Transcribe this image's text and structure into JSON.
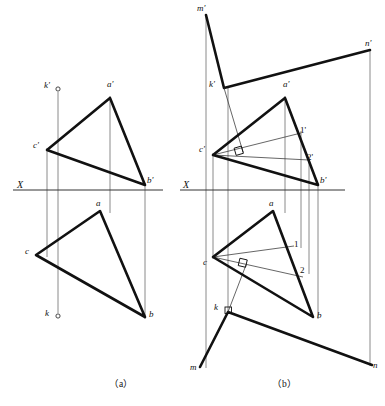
{
  "figure": {
    "type": "descriptive-geometry-orthographic-projection",
    "captions": [
      {
        "id": "cap-a",
        "text": "（a）",
        "x": 120,
        "y": 381
      },
      {
        "id": "cap-b",
        "text": "（b）",
        "x": 283,
        "y": 381
      }
    ],
    "axis_label": "X",
    "colors": {
      "ink": "#111111",
      "thin_line": "#555555",
      "projection_line": "#6d6d6d",
      "background": "#ffffff"
    },
    "stroke_widths": {
      "heavy": 2.6,
      "axis": 1.0,
      "thin": 0.7,
      "projector": 0.7
    }
  },
  "panel_a": {
    "name": "panel-a",
    "x_axis": {
      "x1": 13,
      "y1": 190,
      "x2": 163,
      "y2": 190
    },
    "x_axis_label": {
      "text": "X",
      "x": 18,
      "y": 180
    },
    "points": {
      "a_front": {
        "label": "a'",
        "x": 110,
        "y": 98
      },
      "b_front": {
        "label": "b'",
        "x": 145,
        "y": 185
      },
      "c_front": {
        "label": "c'",
        "x": 47,
        "y": 150
      },
      "a_top": {
        "label": "a",
        "x": 100,
        "y": 211
      },
      "b_top": {
        "label": "b",
        "x": 145,
        "y": 317
      },
      "c_top": {
        "label": "c",
        "x": 36,
        "y": 255
      },
      "k_front": {
        "label": "k'",
        "x": 58,
        "y": 89
      },
      "k_top": {
        "label": "k",
        "x": 58,
        "y": 316
      }
    },
    "labels": [
      {
        "id": "label-a-prime",
        "text": "a'",
        "x": 110,
        "y": 85
      },
      {
        "id": "label-b-prime",
        "text": "b'",
        "x": 148,
        "y": 178
      },
      {
        "id": "label-c-prime",
        "text": "c'",
        "x": 34,
        "y": 140
      },
      {
        "id": "label-a",
        "text": "a",
        "x": 98,
        "y": 199
      },
      {
        "id": "label-b",
        "text": "b",
        "x": 149,
        "y": 312
      },
      {
        "id": "label-c",
        "text": "c",
        "x": 26,
        "y": 248
      },
      {
        "id": "label-k-prime",
        "text": "k'",
        "x": 45,
        "y": 80
      },
      {
        "id": "label-k",
        "text": "k",
        "x": 45,
        "y": 309
      }
    ],
    "front_triangle": "a'-b'-c'",
    "top_triangle": "a-b-c",
    "projectors": [
      {
        "id": "proj-c",
        "x": 47,
        "y1": 150,
        "y2": 255
      },
      {
        "id": "proj-a",
        "x": 110,
        "y1": 98,
        "y2": 211
      },
      {
        "id": "proj-b",
        "x": 145,
        "y1": 185,
        "y2": 317
      },
      {
        "id": "proj-k",
        "x": 58,
        "y1": 89,
        "y2": 316
      }
    ]
  },
  "panel_b": {
    "name": "panel-b",
    "x_axis": {
      "x1": 180,
      "y1": 190,
      "x2": 345,
      "y2": 190
    },
    "x_axis_label": {
      "text": "X",
      "x": 183,
      "y": 180
    },
    "points": {
      "a_front": {
        "label": "a'",
        "x": 285,
        "y": 98
      },
      "b_front": {
        "label": "b'",
        "x": 318,
        "y": 185
      },
      "c_front": {
        "label": "c'",
        "x": 213,
        "y": 155
      },
      "a_top": {
        "label": "a",
        "x": 273,
        "y": 211
      },
      "b_top": {
        "label": "b",
        "x": 313,
        "y": 317
      },
      "c_top": {
        "label": "c",
        "x": 213,
        "y": 257
      },
      "k_front": {
        "label": "k'",
        "x": 224,
        "y": 88
      },
      "k_top": {
        "label": "k",
        "x": 228,
        "y": 312
      },
      "m_front": {
        "label": "m'",
        "x": 206,
        "y": 15
      },
      "n_front": {
        "label": "n'",
        "x": 370,
        "y": 50
      },
      "m_top": {
        "label": "m",
        "x": 200,
        "y": 367
      },
      "n_top": {
        "label": "n",
        "x": 372,
        "y": 365
      },
      "one_front": {
        "label": "1'",
        "x": 301,
        "y": 133
      },
      "two_front": {
        "label": "2'",
        "x": 309,
        "y": 160
      },
      "one_top": {
        "label": "1",
        "x": 294,
        "y": 246
      },
      "two_top": {
        "label": "2",
        "x": 300,
        "y": 272
      }
    },
    "labels": [
      {
        "id": "label-a-prime",
        "text": "a'",
        "x": 284,
        "y": 85
      },
      {
        "id": "label-b-prime",
        "text": "b'",
        "x": 321,
        "y": 178
      },
      {
        "id": "label-c-prime",
        "text": "c'",
        "x": 200,
        "y": 145
      },
      {
        "id": "label-a",
        "text": "a",
        "x": 270,
        "y": 199
      },
      {
        "id": "label-b",
        "text": "b",
        "x": 317,
        "y": 312
      },
      {
        "id": "label-c",
        "text": "c",
        "x": 203,
        "y": 259
      },
      {
        "id": "label-k-prime",
        "text": "k'",
        "x": 210,
        "y": 81
      },
      {
        "id": "label-k",
        "text": "k",
        "x": 215,
        "y": 305
      },
      {
        "id": "label-m-prime",
        "text": "m'",
        "x": 198,
        "y": 7
      },
      {
        "id": "label-n-prime",
        "text": "n'",
        "x": 366,
        "y": 41
      },
      {
        "id": "label-m",
        "text": "m",
        "x": 192,
        "y": 365
      },
      {
        "id": "label-n",
        "text": "n",
        "x": 373,
        "y": 363
      },
      {
        "id": "label-one-prime",
        "text": "1'",
        "x": 301,
        "y": 125
      },
      {
        "id": "label-two-prime",
        "text": "2'",
        "x": 308,
        "y": 153
      },
      {
        "id": "label-one",
        "text": "1",
        "x": 294,
        "y": 239
      },
      {
        "id": "label-two",
        "text": "2",
        "x": 300,
        "y": 265
      }
    ],
    "auxiliary_lines": [
      {
        "id": "aux-c1-front",
        "from": "c'",
        "to": "1'",
        "note": "frontal projection of horizontal line C-1"
      },
      {
        "id": "aux-c2-front",
        "from": "c'",
        "to": "2'",
        "note": "frontal projection of frontal line C-2 (parallel to X)"
      },
      {
        "id": "aux-c1-top",
        "from": "c",
        "to": "1",
        "note": "horizontal projection of C-1 (parallel to X)"
      },
      {
        "id": "aux-c2-top",
        "from": "c",
        "to": "2",
        "note": "horizontal projection of frontal line C-2"
      },
      {
        "id": "perp-front",
        "from": "k'",
        "to": "foot on c'1'",
        "note": "k'm' ⟂ c'1'"
      },
      {
        "id": "perp-top",
        "from": "k",
        "to": "foot on c2",
        "note": "km ⟂ c2"
      }
    ],
    "right_angle_marks": [
      {
        "id": "right-angle-front",
        "x": 239,
        "y": 152
      },
      {
        "id": "right-angle-top",
        "x": 243,
        "y": 266
      },
      {
        "id": "right-angle-k",
        "x": 228,
        "y": 312
      }
    ],
    "projectors": [
      {
        "id": "proj-m",
        "x": 206,
        "y1": 15,
        "y2": 367
      },
      {
        "id": "proj-c",
        "x": 213,
        "y1": 155,
        "y2": 257
      },
      {
        "id": "proj-k",
        "x": 228,
        "y1": 88,
        "y2": 312
      },
      {
        "id": "proj-a",
        "x": 285,
        "y1": 98,
        "y2": 211
      },
      {
        "id": "proj-1",
        "x": 301,
        "y1": 133,
        "y2": 246
      },
      {
        "id": "proj-2",
        "x": 309,
        "y1": 160,
        "y2": 272
      },
      {
        "id": "proj-b",
        "x": 318,
        "y1": 185,
        "y2": 317
      },
      {
        "id": "proj-n",
        "x": 370,
        "y1": 50,
        "y2": 365
      }
    ]
  }
}
